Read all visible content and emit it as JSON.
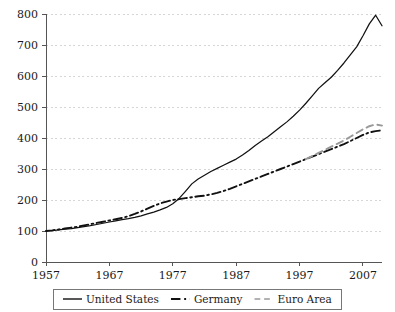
{
  "chart_data": {
    "type": "line",
    "title": "",
    "subtitle": "",
    "xlabel": "",
    "ylabel": "",
    "xlim": [
      1957,
      2010
    ],
    "ylim": [
      0,
      800
    ],
    "xticks": [
      1957,
      1967,
      1977,
      1987,
      1997,
      2007
    ],
    "yticks": [
      0,
      100,
      200,
      300,
      400,
      500,
      600,
      700,
      800
    ],
    "grid": true,
    "grid_axis": "y",
    "legend_position": "bottom-center",
    "index_base_year": 1957,
    "index_base_value": 100,
    "series": [
      {
        "name": "United States",
        "style": "solid",
        "color": "#111111",
        "x": [
          1957,
          1958,
          1959,
          1960,
          1961,
          1962,
          1963,
          1964,
          1965,
          1966,
          1967,
          1968,
          1969,
          1970,
          1971,
          1972,
          1973,
          1974,
          1975,
          1976,
          1977,
          1978,
          1979,
          1980,
          1981,
          1982,
          1983,
          1984,
          1985,
          1986,
          1987,
          1988,
          1989,
          1990,
          1991,
          1992,
          1993,
          1994,
          1995,
          1996,
          1997,
          1998,
          1999,
          2000,
          2001,
          2002,
          2003,
          2004,
          2005,
          2006,
          2007,
          2008,
          2009,
          2010
        ],
        "values": [
          100,
          101,
          104,
          106,
          108,
          111,
          114,
          117,
          121,
          125,
          129,
          133,
          137,
          140,
          144,
          149,
          155,
          161,
          168,
          176,
          188,
          205,
          228,
          252,
          268,
          280,
          292,
          302,
          312,
          322,
          332,
          345,
          360,
          376,
          390,
          404,
          420,
          436,
          452,
          470,
          490,
          512,
          536,
          560,
          578,
          596,
          618,
          642,
          668,
          694,
          730,
          768,
          796,
          762
        ]
      },
      {
        "name": "Germany",
        "style": "dashdot",
        "color": "#111111",
        "x": [
          1957,
          1958,
          1959,
          1960,
          1961,
          1962,
          1963,
          1964,
          1965,
          1966,
          1967,
          1968,
          1969,
          1970,
          1971,
          1972,
          1973,
          1974,
          1975,
          1976,
          1977,
          1978,
          1979,
          1980,
          1981,
          1982,
          1983,
          1984,
          1985,
          1986,
          1987,
          1988,
          1989,
          1990,
          1991,
          1992,
          1993,
          1994,
          1995,
          1996,
          1997,
          1998,
          1999,
          2000,
          2001,
          2002,
          2003,
          2004,
          2005,
          2006,
          2007,
          2008,
          2009,
          2010
        ],
        "values": [
          100,
          102,
          105,
          108,
          111,
          114,
          118,
          122,
          126,
          130,
          134,
          138,
          142,
          148,
          155,
          163,
          172,
          181,
          189,
          195,
          200,
          203,
          206,
          209,
          212,
          214,
          218,
          223,
          229,
          236,
          244,
          252,
          260,
          268,
          276,
          284,
          292,
          300,
          308,
          316,
          324,
          332,
          340,
          348,
          356,
          364,
          372,
          380,
          390,
          400,
          410,
          418,
          422,
          425
        ]
      },
      {
        "name": "Euro Area",
        "style": "dashed",
        "color": "#999999",
        "x": [
          1998,
          1999,
          2000,
          2001,
          2002,
          2003,
          2004,
          2005,
          2006,
          2007,
          2008,
          2009,
          2010
        ],
        "values": [
          332,
          342,
          352,
          362,
          372,
          382,
          392,
          404,
          416,
          428,
          438,
          444,
          440
        ]
      }
    ]
  },
  "legend": {
    "items": [
      {
        "label": "United States",
        "marker": "solid-line"
      },
      {
        "label": "Germany",
        "marker": "dashdot-line"
      },
      {
        "label": "Euro Area",
        "marker": "dashed-line"
      }
    ]
  },
  "axes": {
    "y_tick_labels": [
      "0",
      "100",
      "200",
      "300",
      "400",
      "500",
      "600",
      "700",
      "800"
    ],
    "x_tick_labels": [
      "1957",
      "1967",
      "1977",
      "1987",
      "1997",
      "2007"
    ]
  },
  "colors": {
    "background": "#ffffff",
    "axis": "#555555",
    "grid": "#cccccc",
    "primary": "#111111",
    "secondary": "#999999"
  }
}
